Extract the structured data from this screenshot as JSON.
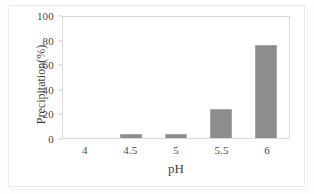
{
  "chart_data": {
    "type": "bar",
    "title": "",
    "xlabel": "pH",
    "ylabel": "Precipitation(%)",
    "categories": [
      "4",
      "4.5",
      "5",
      "5.5",
      "6"
    ],
    "values": [
      0,
      3,
      3,
      23.5,
      75.6
    ],
    "series": [
      {
        "name": "Precipitation",
        "values": [
          0,
          3,
          3,
          23.5,
          75.6
        ]
      }
    ],
    "ylim": [
      0,
      100
    ],
    "yticks": [
      "0",
      "20",
      "40",
      "60",
      "80",
      "100"
    ],
    "ytick_values": [
      0,
      20,
      40,
      60,
      80,
      100
    ],
    "grid": false,
    "legend": false,
    "legend_position": "none",
    "bar_color": "#8d8d8d",
    "plot_border_color": "#d9d9d9",
    "text_color": "#4a4a4a",
    "background": "#ffffff"
  },
  "axes": {
    "y_title": "Precipitation(%)",
    "x_title": "pH"
  }
}
